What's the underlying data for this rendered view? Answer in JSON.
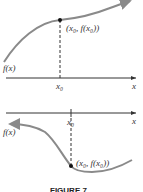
{
  "figure": {
    "caption": "FIGURE 7",
    "curve_color": "#8a8a8a",
    "axis_color": "#333333",
    "top_panel": {
      "function_label": "f(x)",
      "axis_label": "x",
      "tick_label": "x₀",
      "point_label": "(x₀, f(x₀))",
      "description": "increasing curve with horizontal tangent at x0 (inflection point)"
    },
    "bottom_panel": {
      "function_label": "f(x)",
      "axis_label": "x",
      "tick_label": "x₀",
      "point_label": "(x₀, f(x₀))",
      "description": "decreasing then increasing curve with minimum at x0"
    }
  }
}
